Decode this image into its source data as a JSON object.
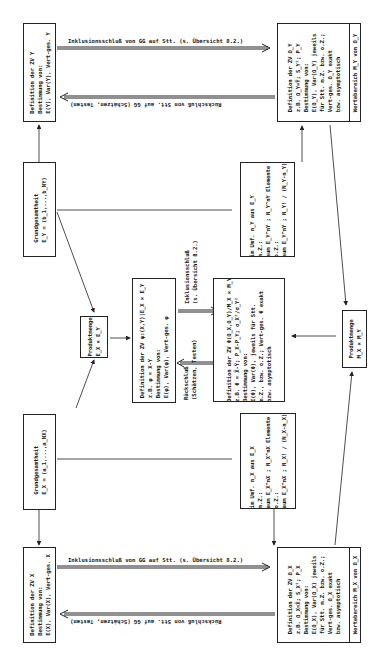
{
  "diagram": {
    "orientation": "rotated-90-ccw",
    "nodes": {
      "def_zv_y": {
        "lines": [
          "Definition der ZV Y",
          "Bestimmung von:",
          "E(Y), Var(Y), Vert-ges. Y"
        ]
      },
      "grund_y": {
        "lines": [
          "Grundgesamtheit",
          "E_Y = (b_1,...,b_NY)"
        ]
      },
      "produkt_e": {
        "lines": [
          "Produktmenge",
          "E_X × E_Y"
        ]
      },
      "grund_x": {
        "lines": [
          "Grundgesamtheit",
          "E_X = (a_1,...,a_NX)"
        ]
      },
      "def_zv_x": {
        "lines": [
          "Definition der ZV X",
          "Bestimmung von:",
          "E(X), Var(X), Vert-ges. X"
        ]
      },
      "def_zv_phi": {
        "lines": [
          "Definition der ZV φ:(X,Y)|E_X × E_Y",
          "z.B. φ = X-Y",
          "Bestimmung von:",
          "E(φ), Var(φ), Vert-ges. φ"
        ]
      },
      "def_zv_phi_omega": {
        "lines": [
          "Definition der ZV Φ(Ω_X,Ω_Y)/M_X × M_Y",
          "z.B. Φ = X̄-Ȳ; P_X-P_Y; σ_X²/σ_Y²",
          "Bestimmung von:",
          "E(Φ), Var(Φ), jeweils für Stt.",
          "m.Z., bzw. o.Z.; Vert-ges. Φ exakt",
          "bzw. asymptotisch"
        ]
      },
      "stt_y": {
        "lines": [
          "Stt. im Umf. n_Y aus E_Y",
          "Stt. m.Z.:",
          "Stt-raum E_Y^nY ; N_Y^nY Elemente",
          "Stt. o.Z.:",
          "Stt-raum E_Y^nY ; N_Y! / (N_Y-n_Y)! El."
        ]
      },
      "stt_x": {
        "lines": [
          "Stt. im Umf. n_X aus E_X",
          "Stt. m.Z.:",
          "Stt-raum E_X^nX ; N_X^nX Elemente",
          "Stt. o.Z.:",
          "Stt-raum E_X^nX ; N_X! / (N_X-n_X)! El."
        ]
      },
      "def_zv_omega_y": {
        "lines": [
          "Definition der ZV Ω_Y",
          "z.B. Ω_Y=Ȳ; S_Y²; P_Y",
          "Bestimmung von:",
          "E(Ω_Y), Var(Ω_Y) jeweils",
          "für Stt. m.Z. bzw. o.Z.;",
          "Vert-ges. Ω_Y exakt",
          "bzw. asymptotisch"
        ],
        "footer": "Wertebereich M_Y von Ω_Y"
      },
      "produkt_m": {
        "lines": [
          "Produktmenge",
          "M_X × M_Y"
        ]
      },
      "def_zv_omega_x": {
        "lines": [
          "Definition der ZV Ω_X",
          "z.B. Ω_X=X̄; S_X²; P_X",
          "Bestimmung von:",
          "E(Ω_X), Var(Ω_X) jeweils",
          "für Stt. m.Z. bzw. o.Z.;",
          "Vert-ges. Ω_X exakt",
          "bzw. asymptotisch"
        ],
        "footer": "Wertebereich M_X von Ω_X"
      }
    },
    "edge_labels": {
      "inklusion_y": "Inklusionsschluß von GG auf Stt. (s. Übersicht 8.2.)",
      "rueck_y": "Rückschluß von Stt. auf GG (Schätzen, Testen)",
      "inklusion_x": "Inklusionsschluß von GG auf Stt. (s. Übersicht 8.2.)",
      "rueck_x": "Rückschluß von Stt. auf GG (Schätzen, Testen)",
      "inklusion_mid_1": "Inklusionsschluß",
      "inklusion_mid_2": "(s. Übersicht 8.2.)",
      "rueck_mid_1": "Rückschluß",
      "rueck_mid_2": "(Schätzen, Testen)"
    },
    "colors": {
      "ink": "#222222",
      "paper": "#ffffff"
    }
  }
}
